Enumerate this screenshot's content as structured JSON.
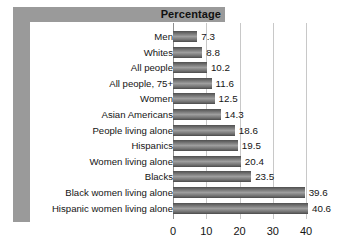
{
  "header": {
    "title": "Percentage"
  },
  "axis": {
    "ticks": [
      "0",
      "10",
      "20",
      "30",
      "40"
    ]
  },
  "chart_data": {
    "type": "bar",
    "orientation": "horizontal",
    "title": "Percentage",
    "xlabel": "",
    "ylabel": "",
    "xlim": [
      0,
      43
    ],
    "grid": true,
    "gridlines": [
      10,
      20,
      30,
      40
    ],
    "legend": "none",
    "bar_color": "#6f6f6f",
    "categories": [
      "Men",
      "Whites",
      "All people",
      "All people, 75+",
      "Women",
      "Asian Americans",
      "People living alone",
      "Hispanics",
      "Women living alone",
      "Blacks",
      "Black women living alone",
      "Hispanic women living alone"
    ],
    "values": [
      7.3,
      8.8,
      10.2,
      11.6,
      12.5,
      14.3,
      18.6,
      19.5,
      20.4,
      23.5,
      39.6,
      40.6
    ],
    "value_labels": [
      "7.3",
      "8.8",
      "10.2",
      "11.6",
      "12.5",
      "14.3",
      "18.6",
      "19.5",
      "20.4",
      "23.5",
      "39.6",
      "40.6"
    ],
    "xticks": [
      0,
      10,
      20,
      30,
      40
    ],
    "xtick_labels": [
      "0",
      "10",
      "20",
      "30",
      "40"
    ]
  }
}
